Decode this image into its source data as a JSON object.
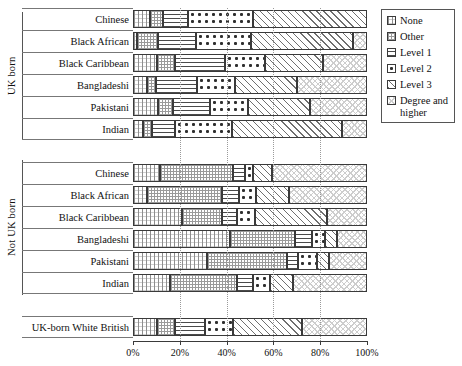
{
  "chart_data": {
    "type": "bar",
    "orientation": "horizontal",
    "stacked": true,
    "normalized_percent": true,
    "title": "",
    "xlabel": "",
    "ylabel": "",
    "xlim": [
      0,
      100
    ],
    "xticks": [
      0,
      20,
      40,
      60,
      80,
      100
    ],
    "xticklabels": [
      "0%",
      "20%",
      "40%",
      "60%",
      "80%",
      "100%"
    ],
    "grid": "vertical-dotted",
    "legend_position": "top-right-outside",
    "series": [
      {
        "name": "None",
        "pattern": "grid-vertical",
        "values": [
          7.3,
          1.7,
          10.3,
          6.0,
          10.7,
          4.3,
          11.5,
          6.0,
          20.9,
          41.5,
          31.6,
          15.8,
          10.3
        ]
      },
      {
        "name": "Other",
        "pattern": "dense-dots",
        "values": [
          5.6,
          9.0,
          7.7,
          3.8,
          6.4,
          3.8,
          31.2,
          32.0,
          17.1,
          27.8,
          34.2,
          28.6,
          7.7
        ]
      },
      {
        "name": "Level 1",
        "pattern": "horizontal-lines",
        "values": [
          10.7,
          16.2,
          21.4,
          17.5,
          15.8,
          9.8,
          5.1,
          7.3,
          6.4,
          7.3,
          4.7,
          6.8,
          12.8
        ]
      },
      {
        "name": "Level 2",
        "pattern": "sparse-dots",
        "values": [
          27.8,
          23.5,
          17.1,
          16.2,
          16.2,
          24.4,
          3.4,
          7.3,
          7.7,
          5.6,
          8.1,
          7.3,
          12.0
        ]
      },
      {
        "name": "Level 3",
        "pattern": "diagonal-hatch",
        "values": [
          48.7,
          43.6,
          24.8,
          26.5,
          26.5,
          47.0,
          8.1,
          14.1,
          30.8,
          5.1,
          5.1,
          9.8,
          29.5
        ]
      },
      {
        "name": "Degree and higher",
        "pattern": "fine-crosshatch",
        "values": [
          0.0,
          6.0,
          18.8,
          29.9,
          24.4,
          10.7,
          40.6,
          33.3,
          17.1,
          12.8,
          16.2,
          31.6,
          27.8
        ]
      }
    ],
    "categories": [
      {
        "label": "Chinese",
        "group": "UK born"
      },
      {
        "label": "Black African",
        "group": "UK born"
      },
      {
        "label": "Black Caribbean",
        "group": "UK born"
      },
      {
        "label": "Bangladeshi",
        "group": "UK born"
      },
      {
        "label": "Pakistani",
        "group": "UK born"
      },
      {
        "label": "Indian",
        "group": "UK born"
      },
      {
        "label": "Chinese",
        "group": "Not UK born"
      },
      {
        "label": "Black African",
        "group": "Not UK born"
      },
      {
        "label": "Black Caribbean",
        "group": "Not UK born"
      },
      {
        "label": "Bangladeshi",
        "group": "Not UK born"
      },
      {
        "label": "Pakistani",
        "group": "Not UK born"
      },
      {
        "label": "Indian",
        "group": "Not UK born"
      },
      {
        "label": "UK-born White British",
        "group": ""
      }
    ],
    "group_labels": [
      "UK born",
      "Not UK born"
    ]
  },
  "legend": {
    "items": [
      {
        "label": "None",
        "pattern": "p-none"
      },
      {
        "label": "Other",
        "pattern": "p-other"
      },
      {
        "label": "Level 1",
        "pattern": "p-l1"
      },
      {
        "label": "Level 2",
        "pattern": "p-l2"
      },
      {
        "label": "Level 3",
        "pattern": "p-l3"
      },
      {
        "label": "Degree and higher",
        "pattern": "p-deg"
      }
    ]
  },
  "colors": {
    "axis": "#3a3a3a",
    "rule": "#777777",
    "gridline": "#9a9a9a",
    "background": "#ffffff",
    "text": "#111111"
  }
}
